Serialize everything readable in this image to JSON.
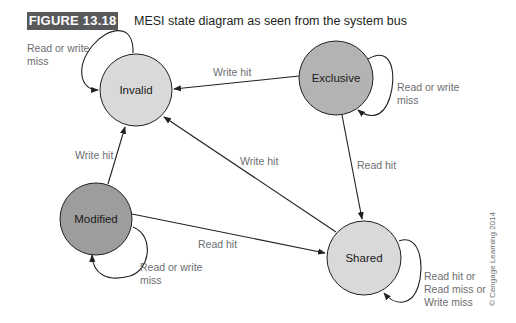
{
  "figure": {
    "label": "FIGURE 13.18",
    "title": "MESI state diagram as seen from the system bus",
    "credit": "© Cengage Learning 2014"
  },
  "colors": {
    "figure_label_bg": "#58595b",
    "invalid_fill": "#d9d9d9",
    "exclusive_fill": "#b3b3b3",
    "modified_fill": "#9d9d9d",
    "shared_fill": "#d9d9d9",
    "edge_label": "#6d6e71"
  },
  "states": [
    {
      "id": "invalid",
      "label": "Invalid"
    },
    {
      "id": "exclusive",
      "label": "Exclusive"
    },
    {
      "id": "modified",
      "label": "Modified"
    },
    {
      "id": "shared",
      "label": "Shared"
    }
  ],
  "transitions": [
    {
      "from": "invalid",
      "to": "invalid",
      "label_lines": [
        "Read or write",
        "miss"
      ]
    },
    {
      "from": "exclusive",
      "to": "invalid",
      "label_lines": [
        "Write hit"
      ]
    },
    {
      "from": "exclusive",
      "to": "exclusive",
      "label_lines": [
        "Read or write",
        "miss"
      ]
    },
    {
      "from": "exclusive",
      "to": "shared",
      "label_lines": [
        "Read hit"
      ]
    },
    {
      "from": "modified",
      "to": "invalid",
      "label_lines": [
        "Write hit"
      ]
    },
    {
      "from": "shared",
      "to": "invalid",
      "label_lines": [
        "Write hit"
      ]
    },
    {
      "from": "modified",
      "to": "shared",
      "label_lines": [
        "Read hit"
      ]
    },
    {
      "from": "modified",
      "to": "modified",
      "label_lines": [
        "Read or write",
        "miss"
      ]
    },
    {
      "from": "shared",
      "to": "shared",
      "label_lines": [
        "Read hit or",
        "Read miss or",
        "Write miss"
      ]
    }
  ]
}
